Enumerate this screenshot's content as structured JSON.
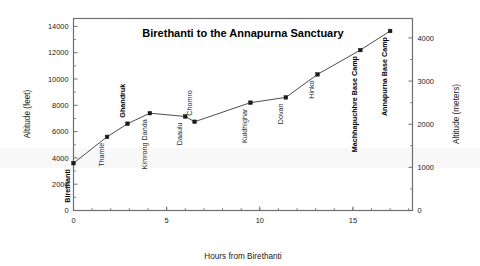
{
  "chart_data": {
    "type": "line",
    "title": "Birethanti to the Annapurna Sanctuary",
    "xlabel": "Hours from Birethanti",
    "ylabel": "Altitude (feet)",
    "y2label": "Altitude (meters)",
    "xlim": [
      0,
      18.2
    ],
    "ylim": [
      0,
      14600
    ],
    "y2lim": [
      0,
      4450
    ],
    "grid": false,
    "legend": "none",
    "x_ticks": [
      0,
      5,
      10,
      15
    ],
    "x_tick_labels": [
      "0",
      "5",
      "10",
      "15"
    ],
    "x_minor_step": 1,
    "y_ticks": [
      0,
      2000,
      4000,
      6000,
      8000,
      10000,
      12000,
      14000
    ],
    "y_tick_labels": [
      "0",
      "2000",
      "4000",
      "6000",
      "8000",
      "10000",
      "12000",
      "14000"
    ],
    "y2_ticks": [
      0,
      1000,
      2000,
      3000,
      4000
    ],
    "y2_tick_labels": [
      "0",
      "1000",
      "2000",
      "3000",
      "4000"
    ],
    "y2_minor_step": 500,
    "x": [
      0,
      1.8,
      2.9,
      4.1,
      6.0,
      6.5,
      9.5,
      11.4,
      13.1,
      15.4,
      17.0
    ],
    "values": [
      3600,
      5600,
      6600,
      7400,
      7150,
      6750,
      8200,
      8600,
      10350,
      12200,
      13650
    ],
    "point_labels": [
      "Birethanti",
      "Thamle",
      "Ghandruk",
      "Kimrong Danda",
      "Daaulu",
      "Chomro",
      "Kuldhighar",
      "Dovan",
      "Hinko",
      "Machhapuchhre Base Camp",
      "Annapurna Base Camp"
    ],
    "point_label_bold": [
      true,
      false,
      true,
      false,
      false,
      false,
      false,
      false,
      false,
      true,
      true
    ],
    "point_label_side": [
      "below",
      "below",
      "above",
      "below",
      "below",
      "above",
      "below",
      "below",
      "below",
      "below",
      "below"
    ],
    "series_name": "Trek altitude profile",
    "marker": "square",
    "line_color": "#3a3a3a",
    "marker_color": "#1a1a1a"
  },
  "figure": {
    "background": "#ffffff",
    "frame_color": "#6e6e6e"
  }
}
